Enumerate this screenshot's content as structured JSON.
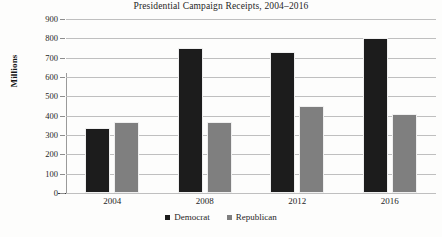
{
  "chart_data": {
    "type": "bar",
    "title": "Presidential Campaign Receipts, 2004–2016",
    "xlabel": "",
    "ylabel": "Millions",
    "categories": [
      "2004",
      "2008",
      "2012",
      "2016"
    ],
    "series": [
      {
        "name": "Democrat",
        "color": "#1c1c1c",
        "values": [
          335,
          750,
          730,
          800
        ]
      },
      {
        "name": "Republican",
        "color": "#7f7f7f",
        "values": [
          368,
          368,
          450,
          410
        ]
      }
    ],
    "ylim": [
      0,
      900
    ],
    "ytick_step": 100,
    "yticks": [
      "900",
      "800",
      "700",
      "600",
      "500",
      "400",
      "300",
      "200",
      "100",
      "0"
    ],
    "grid": true,
    "legend_position": "bottom"
  }
}
